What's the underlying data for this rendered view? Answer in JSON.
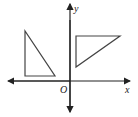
{
  "diagram": {
    "axes": {
      "x_label": "x",
      "y_label": "y",
      "origin_label": "O"
    },
    "shapes": [
      {
        "name": "left-triangle",
        "points": [
          [
            25,
            31
          ],
          [
            25,
            76
          ],
          [
            55,
            76
          ]
        ]
      },
      {
        "name": "right-triangle",
        "points": [
          [
            76,
            36
          ],
          [
            120,
            36
          ],
          [
            76,
            67
          ]
        ]
      }
    ],
    "colors": {
      "stroke": "#333333"
    }
  }
}
